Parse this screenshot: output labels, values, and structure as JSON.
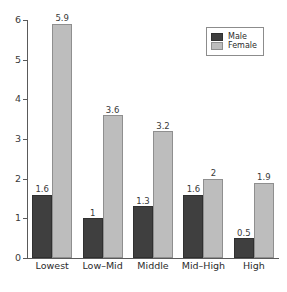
{
  "chart_data": {
    "type": "bar",
    "title": "",
    "subtitle": "",
    "xlabel": "",
    "ylabel": "",
    "categories": [
      "Lowest",
      "Low–Mid",
      "Middle",
      "Mid–High",
      "High"
    ],
    "series": [
      {
        "name": "Male",
        "color": "#3f3f3f",
        "values": [
          1.6,
          1,
          1.3,
          1.6,
          0.5
        ],
        "labels": [
          "1.6",
          "1",
          "1.3",
          "1.6",
          "0.5"
        ]
      },
      {
        "name": "Female",
        "color": "#bdbdbd",
        "values": [
          5.9,
          3.6,
          3.2,
          2,
          1.9
        ],
        "labels": [
          "5.9",
          "3.6",
          "3.2",
          "2",
          "1.9"
        ]
      }
    ],
    "ylim": [
      0,
      6
    ],
    "yticks": [
      0,
      1,
      2,
      3,
      4,
      5,
      6
    ],
    "ytick_labels": [
      "0",
      "1",
      "2",
      "3",
      "4",
      "5",
      "6"
    ],
    "grid": false,
    "legend_position": "top-right",
    "bar_labels_shown": true
  },
  "legend": {
    "entries": [
      {
        "label": "Male",
        "swatch": "male"
      },
      {
        "label": "Female",
        "swatch": "female"
      }
    ]
  }
}
